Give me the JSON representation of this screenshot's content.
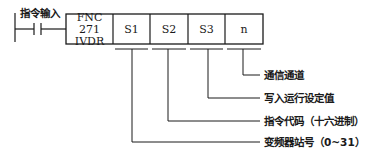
{
  "instruction": {
    "input_label": "指令输入",
    "function_code": "FNC 271",
    "mnemonic": "IVDR",
    "operands": [
      "S1",
      "S2",
      "S3",
      "n"
    ]
  },
  "annotations": [
    {
      "operand": "n",
      "text": "通信通道"
    },
    {
      "operand": "S3",
      "text": "写入运行设定值"
    },
    {
      "operand": "S2",
      "text": "指令代码（十六进制）"
    },
    {
      "operand": "S1",
      "text": "变频器站号（0~31）"
    }
  ],
  "colors": {
    "line": "#1a1a1a",
    "background": "#ffffff"
  }
}
